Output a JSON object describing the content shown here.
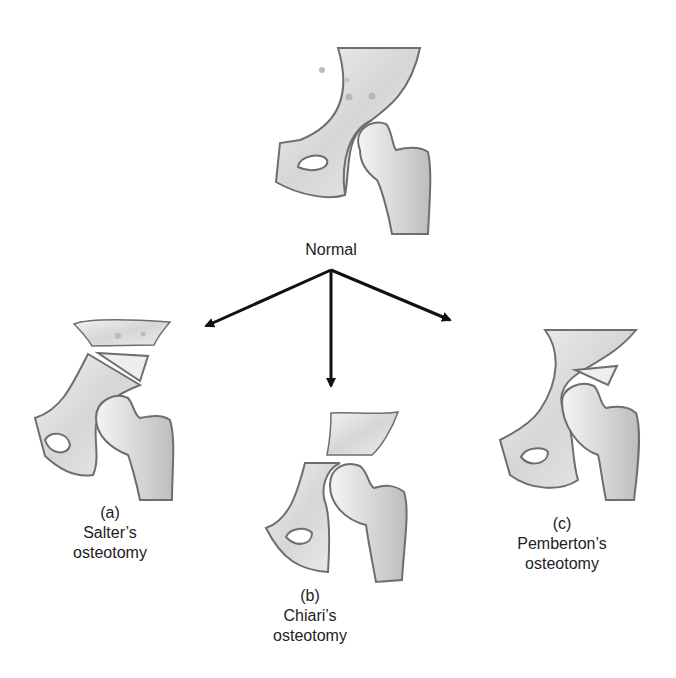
{
  "figure": {
    "colors": {
      "bone_outline": "#6e6e6e",
      "bone_fill": "#e4e4e4",
      "bone_shade": "#c8c8c8",
      "arrow": "#111111",
      "text": "#222222",
      "background": "#ffffff"
    },
    "panels": {
      "normal": {
        "label": "Normal"
      },
      "salter": {
        "letter": "(a)",
        "name": "Salter’s",
        "suffix": "osteotomy"
      },
      "chiari": {
        "letter": "(b)",
        "name": "Chiari’s",
        "suffix": "osteotomy"
      },
      "pemberton": {
        "letter": "(c)",
        "name": "Pemberton’s",
        "suffix": "osteotomy"
      }
    },
    "arrows": [
      {
        "from": "normal",
        "to": "salter",
        "direction": "down-left"
      },
      {
        "from": "normal",
        "to": "chiari",
        "direction": "down"
      },
      {
        "from": "normal",
        "to": "pemberton",
        "direction": "down-right"
      }
    ]
  }
}
